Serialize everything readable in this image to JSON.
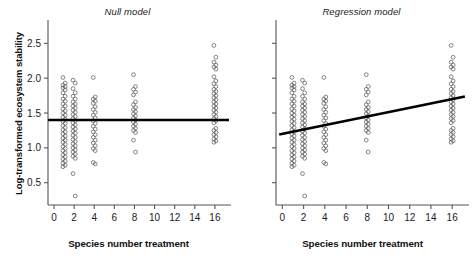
{
  "figure": {
    "background_color": "#ffffff",
    "axis_color": "#555555",
    "point_color": "#666666",
    "line_color": "#000000"
  },
  "panels": [
    {
      "id": "null",
      "title": "Null model",
      "xlabel": "Species number treatment",
      "ylabel": "Log-transformed ecosystem stability",
      "show_y_tick_labels": true,
      "fit": {
        "type": "horizontal",
        "intercept": 1.4,
        "slope": 0.0
      }
    },
    {
      "id": "regression",
      "title": "Regression model",
      "xlabel": "Species number treatment",
      "ylabel": "Log-transformed ecosystem stability",
      "show_y_tick_labels": false,
      "fit": {
        "type": "linear",
        "intercept": 1.2,
        "slope": 0.0312
      }
    }
  ],
  "chart_data": {
    "type": "scatter",
    "panel_titles": [
      "Null model",
      "Regression model"
    ],
    "xlabel": "Species number treatment",
    "ylabel": "Log-transformed ecosystem stability",
    "xlim": [
      -0.6,
      17.4
    ],
    "ylim": [
      0.18,
      2.72
    ],
    "xticks": [
      0,
      2,
      4,
      6,
      8,
      10,
      12,
      14,
      16
    ],
    "xtick_labels": [
      "0",
      "2",
      "4",
      "6",
      "8",
      "10",
      "12",
      "14",
      "16"
    ],
    "yticks": [
      0.5,
      1.0,
      1.5,
      2.0,
      2.5
    ],
    "ytick_labels": [
      "0.5",
      "1.0",
      "1.5",
      "2.0",
      "2.5"
    ],
    "grid": false,
    "legend": null,
    "marker": "open-circle",
    "treatment_levels": [
      1,
      2,
      4,
      8,
      16
    ],
    "note": "Both panels plot the same observed data; only the fitted model line differs.",
    "series": [
      {
        "name": "observations",
        "points_by_treatment": {
          "1": [
            2.01,
            1.93,
            1.9,
            1.88,
            1.86,
            1.83,
            1.79,
            1.74,
            1.7,
            1.67,
            1.63,
            1.6,
            1.56,
            1.53,
            1.5,
            1.47,
            1.44,
            1.41,
            1.38,
            1.35,
            1.32,
            1.29,
            1.26,
            1.23,
            1.2,
            1.17,
            1.14,
            1.11,
            1.08,
            1.05,
            1.02,
            0.99,
            0.96,
            0.93,
            0.9,
            0.87,
            0.84,
            0.81,
            0.78,
            0.75,
            0.73
          ],
          "2": [
            1.97,
            1.93,
            1.85,
            1.79,
            1.74,
            1.7,
            1.66,
            1.63,
            1.6,
            1.57,
            1.54,
            1.51,
            1.48,
            1.45,
            1.42,
            1.39,
            1.36,
            1.33,
            1.3,
            1.27,
            1.24,
            1.21,
            1.18,
            1.15,
            1.12,
            1.09,
            1.06,
            1.03,
            1.0,
            0.97,
            0.94,
            0.91,
            0.88,
            0.85,
            0.63,
            0.31
          ],
          "4": [
            2.01,
            1.73,
            1.7,
            1.67,
            1.64,
            1.59,
            1.55,
            1.51,
            1.47,
            1.43,
            1.39,
            1.35,
            1.31,
            1.27,
            1.23,
            1.19,
            1.15,
            1.11,
            1.07,
            1.03,
            0.99,
            0.96,
            0.79,
            0.77
          ],
          "8": [
            2.05,
            1.88,
            1.84,
            1.8,
            1.76,
            1.66,
            1.62,
            1.58,
            1.55,
            1.52,
            1.49,
            1.46,
            1.43,
            1.4,
            1.37,
            1.34,
            1.31,
            1.28,
            1.25,
            1.22,
            1.11,
            0.94
          ],
          "16": [
            2.47,
            2.3,
            2.23,
            2.19,
            2.16,
            2.13,
            2.02,
            1.96,
            1.92,
            1.88,
            1.84,
            1.81,
            1.78,
            1.75,
            1.72,
            1.69,
            1.66,
            1.63,
            1.6,
            1.57,
            1.54,
            1.51,
            1.48,
            1.45,
            1.42,
            1.39,
            1.36,
            1.28,
            1.25,
            1.22,
            1.19,
            1.16,
            1.13,
            1.1,
            1.08
          ]
        }
      }
    ],
    "fits": [
      {
        "panel": "Null model",
        "type": "horizontal",
        "intercept": 1.4,
        "slope": 0.0,
        "x_range": [
          -0.6,
          17.4
        ]
      },
      {
        "panel": "Regression model",
        "type": "linear",
        "intercept": 1.2,
        "slope": 0.0312,
        "x_range": [
          -0.3,
          17.2
        ]
      }
    ]
  }
}
